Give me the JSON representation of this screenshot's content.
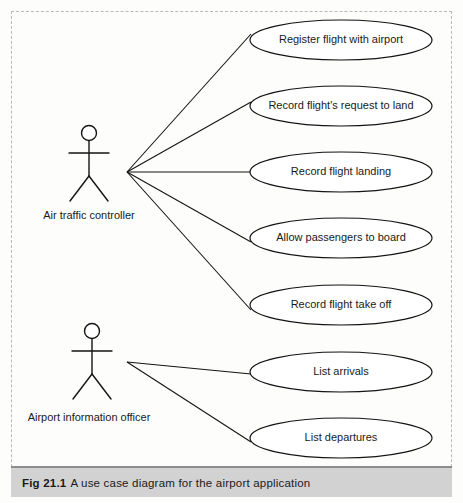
{
  "figure": {
    "caption_number": "Fig 21.1",
    "caption_text": "A use case diagram for the airport application"
  },
  "diagram": {
    "type": "uml-use-case-diagram",
    "actors": [
      {
        "id": "air-traffic-controller",
        "label": "Air traffic controller",
        "head_cx": 89,
        "head_cy": 133,
        "head_r": 7.5,
        "body_top": 141,
        "body_bottom": 176,
        "arm_y": 153,
        "arm_left_x": 69,
        "arm_right_x": 109,
        "leg_left_x": 70,
        "leg_right_x": 108,
        "leg_bottom_y": 201,
        "label_x": 89,
        "label_y": 216,
        "fan_x": 127,
        "fan_y": 172
      },
      {
        "id": "airport-information-officer",
        "label": "Airport information officer",
        "head_cx": 92,
        "head_cy": 331,
        "head_r": 7.5,
        "body_top": 339,
        "body_bottom": 374,
        "arm_y": 351,
        "arm_left_x": 72,
        "arm_right_x": 112,
        "leg_left_x": 73,
        "leg_right_x": 111,
        "leg_bottom_y": 399,
        "label_x": 89,
        "label_y": 418,
        "fan_x": 127,
        "fan_y": 362
      }
    ],
    "use_cases": [
      {
        "id": "register-flight-with-airport",
        "label": "Register flight with airport",
        "cx": 341,
        "cy": 40,
        "rx": 91,
        "ry": 20
      },
      {
        "id": "record-flights-request-to-land",
        "label": "Record flight's request to land",
        "cx": 341,
        "cy": 106,
        "rx": 91,
        "ry": 20
      },
      {
        "id": "record-flight-landing",
        "label": "Record flight landing",
        "cx": 341,
        "cy": 172,
        "rx": 91,
        "ry": 20
      },
      {
        "id": "allow-passengers-to-board",
        "label": "Allow passengers to board",
        "cx": 341,
        "cy": 238,
        "rx": 91,
        "ry": 20
      },
      {
        "id": "record-flight-take-off",
        "label": "Record flight take off",
        "cx": 341,
        "cy": 305,
        "rx": 91,
        "ry": 20
      },
      {
        "id": "list-arrivals",
        "label": "List arrivals",
        "cx": 341,
        "cy": 372,
        "rx": 91,
        "ry": 20
      },
      {
        "id": "list-departures",
        "label": "List departures",
        "cx": 341,
        "cy": 438,
        "rx": 91,
        "ry": 20
      }
    ],
    "associations": [
      {
        "id": "assoc-atc-register-flight",
        "from": "air-traffic-controller",
        "to": "register-flight-with-airport",
        "x1": 127,
        "y1": 172,
        "x2": 251,
        "y2": 34
      },
      {
        "id": "assoc-atc-request-to-land",
        "from": "air-traffic-controller",
        "to": "record-flights-request-to-land",
        "x1": 127,
        "y1": 172,
        "x2": 251,
        "y2": 102
      },
      {
        "id": "assoc-atc-record-landing",
        "from": "air-traffic-controller",
        "to": "record-flight-landing",
        "x1": 127,
        "y1": 172,
        "x2": 251,
        "y2": 172
      },
      {
        "id": "assoc-atc-allow-board",
        "from": "air-traffic-controller",
        "to": "allow-passengers-to-board",
        "x1": 127,
        "y1": 172,
        "x2": 251,
        "y2": 242
      },
      {
        "id": "assoc-atc-take-off",
        "from": "air-traffic-controller",
        "to": "record-flight-take-off",
        "x1": 127,
        "y1": 172,
        "x2": 251,
        "y2": 310
      },
      {
        "id": "assoc-aio-list-arrivals",
        "from": "airport-information-officer",
        "to": "list-arrivals",
        "x1": 127,
        "y1": 362,
        "x2": 251,
        "y2": 374
      },
      {
        "id": "assoc-aio-list-departures",
        "from": "airport-information-officer",
        "to": "list-departures",
        "x1": 127,
        "y1": 362,
        "x2": 251,
        "y2": 442
      }
    ]
  }
}
